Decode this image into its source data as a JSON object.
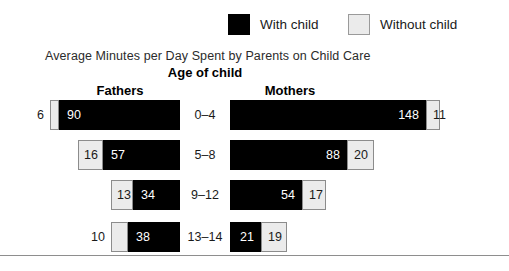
{
  "legend": {
    "items": [
      {
        "label": "With child",
        "color": "#000000",
        "swatch": "black"
      },
      {
        "label": "Without child",
        "color": "#ebebeb",
        "swatch": "gray"
      }
    ]
  },
  "titles": {
    "chart_title": "Average Minutes per Day Spent by Parents on Child Care",
    "axis_title": "Age of child",
    "column_left": "Fathers",
    "column_right": "Mothers"
  },
  "chart_data": {
    "type": "bar",
    "orientation": "horizontal",
    "layout": "bidirectional-stacked-pyramid",
    "title": "Average Minutes per Day Spent by Parents on Child Care",
    "xlabel": "Average minutes per day",
    "ylabel": "Age of child",
    "categories": [
      "0–4",
      "5–8",
      "9–12",
      "13–14"
    ],
    "panels": [
      "Fathers",
      "Mothers"
    ],
    "legend": [
      "With child",
      "Without child"
    ],
    "grid": false,
    "legend_position": "top",
    "units": "minutes per day",
    "series": [
      {
        "panel": "Fathers",
        "direction": "left",
        "stack_order_from_center": [
          "With child",
          "Without child"
        ],
        "data": [
          {
            "category": "0–4",
            "with_child": 90,
            "without_child": 6
          },
          {
            "category": "5–8",
            "with_child": 57,
            "without_child": 16
          },
          {
            "category": "9–12",
            "with_child": 34,
            "without_child": 13
          },
          {
            "category": "13–14",
            "with_child": 38,
            "without_child": 10
          }
        ]
      },
      {
        "panel": "Mothers",
        "direction": "right",
        "stack_order_from_center": [
          "With child",
          "Without child"
        ],
        "data": [
          {
            "category": "0–4",
            "with_child": 148,
            "without_child": 11
          },
          {
            "category": "5–8",
            "with_child": 88,
            "without_child": 20
          },
          {
            "category": "9–12",
            "with_child": 54,
            "without_child": 17
          },
          {
            "category": "13–14",
            "with_child": 21,
            "without_child": 19
          }
        ]
      }
    ]
  },
  "rows": [
    {
      "category": "0–4",
      "fathers": {
        "black": "90",
        "gray": "6",
        "black_px": 121,
        "gray_px": 9,
        "gray_outside": true
      },
      "mothers": {
        "black": "148",
        "gray": "11",
        "black_px": 196,
        "gray_px": 14,
        "gray_outside": false
      }
    },
    {
      "category": "5–8",
      "fathers": {
        "black": "57",
        "gray": "16",
        "black_px": 77,
        "gray_px": 25,
        "gray_outside": false
      },
      "mothers": {
        "black": "88",
        "gray": "20",
        "black_px": 117,
        "gray_px": 27,
        "gray_outside": false
      }
    },
    {
      "category": "9–12",
      "fathers": {
        "black": "34",
        "gray": "13",
        "black_px": 47,
        "gray_px": 22,
        "gray_outside": false
      },
      "mothers": {
        "black": "54",
        "gray": "17",
        "black_px": 72,
        "gray_px": 24,
        "gray_outside": false
      }
    },
    {
      "category": "13–14",
      "fathers": {
        "black": "38",
        "gray": "10",
        "black_px": 52,
        "gray_px": 17,
        "gray_outside": true
      },
      "mothers": {
        "black": "21",
        "gray": "19",
        "black_px": 31,
        "gray_px": 26,
        "gray_outside": false
      }
    }
  ],
  "row_tops": [
    2,
    42,
    82,
    124
  ]
}
